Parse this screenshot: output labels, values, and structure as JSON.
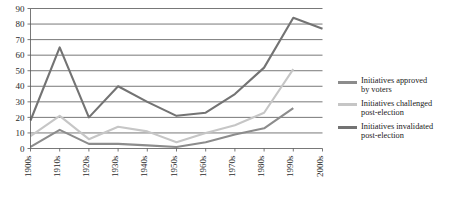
{
  "chart_data": {
    "type": "line",
    "title": "",
    "xlabel": "",
    "ylabel": "",
    "categories": [
      "1900s",
      "1910s",
      "1920s",
      "1930s",
      "1940s",
      "1950s",
      "1960s",
      "1970s",
      "1980s",
      "1990s",
      "2000s"
    ],
    "ylim": [
      0,
      90
    ],
    "ytick_step": 10,
    "yticks": [
      0,
      10,
      20,
      30,
      40,
      50,
      60,
      70,
      80,
      90
    ],
    "grid": "horizontal",
    "legend_position": "right",
    "series": [
      {
        "name": "Initiatives approved by voters",
        "color": "#8c8c8c",
        "values": [
          1,
          12,
          3,
          3,
          2,
          1,
          4,
          9,
          13,
          26,
          null
        ]
      },
      {
        "name": "Initiatives challenged post-election",
        "color": "#c6c6c6",
        "values": [
          8,
          21,
          6,
          14,
          11,
          4,
          10,
          15,
          23,
          51,
          null
        ]
      },
      {
        "name": "Initiatives invalidated post-election",
        "color": "#737373",
        "values": [
          18,
          65,
          20,
          40,
          30,
          21,
          23,
          35,
          52,
          84,
          77
        ]
      }
    ]
  },
  "legend": {
    "entries": [
      {
        "label": "Initiatives approved\nby voters",
        "color": "#8c8c8c"
      },
      {
        "label": "Initiatives challenged\npost-election",
        "color": "#c6c6c6"
      },
      {
        "label": "Initiatives invalidated\npost-election",
        "color": "#737373"
      }
    ]
  },
  "caption": {
    "text": ""
  }
}
